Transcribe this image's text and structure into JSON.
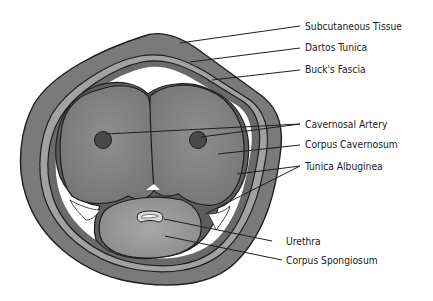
{
  "diagram": {
    "title": "",
    "labels": {
      "subcutaneous_tissue": "Subcutaneous Tissue",
      "dartos_tunica": "Dartos Tunica",
      "bucks_fascia": "Buck's Fascia",
      "cavernosal_artery": "Cavernosal Artery",
      "corpus_cavernosum": "Corpus Cavernosum",
      "tunica_albuginea": "Tunica Albuginea",
      "urethra": "Urethra",
      "corpus_spongiosum": "Corpus Spongiosum"
    },
    "colors": {
      "outer_layer": "#7a7a7a",
      "dartos_band": "#a0a0a0",
      "bucks_band": "#6b6b6b",
      "corpus": "#858585",
      "artery": "#4a4a4a",
      "spongiosum": "#9a9a9a",
      "outline": "#1e1e1e",
      "background": "#ffffff"
    }
  }
}
